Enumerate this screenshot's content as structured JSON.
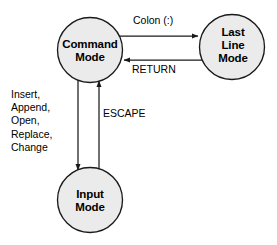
{
  "diagram": {
    "background_color": "#ffffff",
    "node_fill_color": "#ebebeb",
    "node_stroke_color": "#1a1a1a",
    "edge_color": "#1a1a1a",
    "text_color": "#000000",
    "nodes": [
      {
        "id": "command-mode",
        "label": "Command\nMode",
        "shape": "circle",
        "cx": 90,
        "cy": 50,
        "r": 32.5
      },
      {
        "id": "last-line-mode",
        "label": "Last\nLine\nMode",
        "shape": "circle",
        "cx": 232,
        "cy": 47,
        "r": 32.5
      },
      {
        "id": "input-mode",
        "label": "Input\nMode",
        "shape": "circle",
        "cx": 90,
        "cy": 200,
        "r": 32.5
      }
    ],
    "edges": [
      {
        "id": "command-to-lastline",
        "from": "command-mode",
        "to": "last-line-mode",
        "label": "Colon (:)",
        "direction": "right"
      },
      {
        "id": "lastline-to-command",
        "from": "last-line-mode",
        "to": "command-mode",
        "label": "RETURN",
        "direction": "left"
      },
      {
        "id": "command-to-input",
        "from": "command-mode",
        "to": "input-mode",
        "label": "Insert,\nAppend,\nOpen,\nReplace,\nChange",
        "direction": "down"
      },
      {
        "id": "input-to-command",
        "from": "input-mode",
        "to": "command-mode",
        "label": "ESCAPE",
        "direction": "up"
      }
    ]
  }
}
